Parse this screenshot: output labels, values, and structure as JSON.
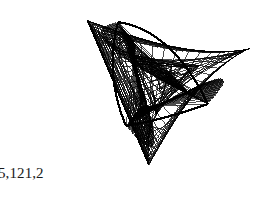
{
  "page": {
    "width": 274,
    "height": 213,
    "background_color": "#ffffff"
  },
  "caption": {
    "text": "5,121,2",
    "color": "#1a1a1a",
    "x": 0,
    "y": 163,
    "font_size": 15,
    "truncated_at_left_edge": true
  },
  "figure": {
    "name": "string-art-envelope-figure",
    "style": "line-art / chord envelope (deltoid-like, 3 cusps)",
    "stroke_color": "#000000",
    "stroke_width": 0.7,
    "background_color": "#ffffff",
    "line_count": 220,
    "bounding_box": {
      "x": 56,
      "y": 10,
      "width": 208,
      "height": 190
    },
    "center": {
      "x": 162,
      "y": 78
    },
    "cusps": [
      {
        "label": "top-left cusp",
        "x": 118,
        "y": 22
      },
      {
        "label": "mid-right cusp",
        "x": 208,
        "y": 104
      },
      {
        "label": "lower-left cusp",
        "x": 126,
        "y": 126
      }
    ],
    "lobe_tips": [
      {
        "label": "left lobe tip",
        "x": 58,
        "y": 32
      },
      {
        "label": "right lobe tip",
        "x": 263,
        "y": 44
      },
      {
        "label": "bottom lobe tip",
        "x": 186,
        "y": 198
      }
    ],
    "generator": {
      "type": "hypocycloid-chord-envelope",
      "cusp_count": 3,
      "radius_x": 96,
      "radius_y": 88,
      "chord_step": 2,
      "rotation_deg": -18,
      "shear": 0.1,
      "passes": [
        {
          "name": "primary",
          "lines": 130,
          "step": 2,
          "alpha": 1.0
        },
        {
          "name": "inner",
          "lines": 70,
          "step": 5,
          "scale": 0.42,
          "alpha": 0.95
        },
        {
          "name": "core",
          "lines": 20,
          "step": 7,
          "scale": 0.16,
          "alpha": 0.9
        }
      ]
    }
  }
}
